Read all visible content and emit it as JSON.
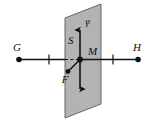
{
  "figure": {
    "type": "geometry-physics-diagram",
    "background_color": "#ffffff",
    "plane": {
      "name": "S",
      "fill_color": "#b3b3b3",
      "stroke_color": "#555555",
      "label": "S"
    },
    "line": {
      "name": "GH",
      "stroke_color": "#111111",
      "left_endpoint_label": "G",
      "right_endpoint_label": "H",
      "tick_count": 2
    },
    "points": [
      {
        "label": "M",
        "role": "intersection-point"
      },
      {
        "label": "G",
        "role": "line-endpoint-left"
      },
      {
        "label": "H",
        "role": "line-endpoint-right"
      }
    ],
    "vectors": [
      {
        "label": "P",
        "direction": "up",
        "role": "upward-vector"
      },
      {
        "label": "F",
        "direction": "down-left",
        "role": "force-vector"
      },
      {
        "label": "",
        "direction": "down",
        "role": "downward-vector"
      }
    ],
    "labels": {
      "G": "G",
      "H": "H",
      "M": "M",
      "S": "S",
      "P": "P",
      "F": "F"
    }
  }
}
